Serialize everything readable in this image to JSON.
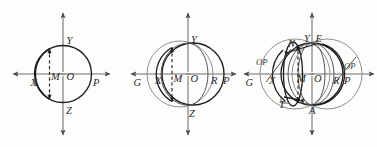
{
  "document": {
    "title": "Three geometric circle diagrams",
    "background_color": "#fdfdfc",
    "ink_color": "#1f1f1f",
    "gray_color": "#8f8f8f"
  },
  "figures": [
    {
      "id": "figure-1",
      "name": "single-circle-diagram",
      "labels": {
        "axis_left": "X",
        "axis_right": "P",
        "axis_top": "Y",
        "axis_bottom": "Z",
        "center": "O",
        "chord_foot": "M"
      },
      "geometry": {
        "center_x": 63,
        "center_y": 74,
        "radius": 28.5,
        "chord_x": 49,
        "axis_x_start": 12,
        "axis_x_end": 110,
        "axis_y_start": 12,
        "axis_y_end": 136
      }
    },
    {
      "id": "figure-2",
      "name": "two-circle-diagram",
      "labels": {
        "axis_left": "G",
        "axis_right": "P",
        "axis_top": "Y",
        "axis_bottom": "Z",
        "center": "O",
        "chord_foot": "M",
        "point_x": "X",
        "point_r": "R"
      },
      "geometry": {
        "center_x": 188,
        "center_y": 74,
        "radius_gray": 33,
        "gray_center_x": 180,
        "radius_dark": 31,
        "dark_center_x": 193,
        "chord_x": 172,
        "axis_x_start": 130,
        "axis_x_end": 236,
        "axis_y_start": 12,
        "axis_y_end": 136
      }
    },
    {
      "id": "figure-3",
      "name": "compound-epicycle-diagram",
      "labels": {
        "axis_left": "G",
        "axis_right": "P",
        "axis_top": "Y",
        "axis_bottom": "A",
        "center": "O",
        "chord_foot": "M",
        "point_x": "X",
        "point_r": "R",
        "point_n": "N",
        "point_e": "E",
        "point_t": "T",
        "orbit_left": "OP",
        "orbit_right": "OP"
      },
      "geometry": {
        "center_x": 312,
        "center_y": 74,
        "gray_left_center_x": 295,
        "gray_left_radius": 35,
        "gray_right_center_x": 327,
        "gray_right_radius": 35,
        "axis_x_start": 243,
        "axis_x_end": 374,
        "axis_y_start": 12,
        "axis_y_end": 136
      }
    }
  ],
  "icons": {
    "arrow_head": "arrowhead-triangle"
  }
}
